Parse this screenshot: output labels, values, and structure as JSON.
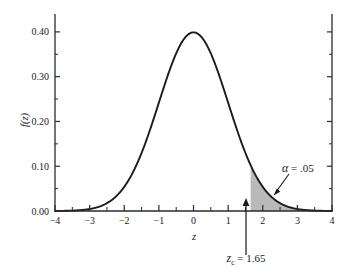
{
  "chart_data": {
    "type": "line",
    "title": "",
    "subtitle": "",
    "xlabel": "z",
    "ylabel": "f(z)",
    "xlim": [
      -4,
      4
    ],
    "ylim": [
      0.0,
      0.44
    ],
    "grid": false,
    "legend": "none",
    "x_ticks": [
      -4,
      -3,
      -2,
      -1,
      0,
      1,
      2,
      3,
      4
    ],
    "x_tick_labels": [
      "-4",
      "-3",
      "-2",
      "-1",
      "0",
      "1",
      "2",
      "3",
      "4"
    ],
    "x_minor_tick_step": 0.5,
    "y_ticks": [
      0.0,
      0.1,
      0.2,
      0.3,
      0.4
    ],
    "y_tick_labels": [
      "0.00",
      "0.10",
      "0.20",
      "0.30",
      "0.40"
    ],
    "y_minor_tick_step": 0.05,
    "series": [
      {
        "name": "standard normal density f(z)",
        "distribution": "normal",
        "mean": 0,
        "sd": 1,
        "peak_value": 0.3989,
        "x": [
          -4.0,
          -3.5,
          -3.0,
          -2.5,
          -2.0,
          -1.65,
          -1.5,
          -1.0,
          -0.5,
          0.0,
          0.5,
          1.0,
          1.5,
          1.65,
          2.0,
          2.5,
          3.0,
          3.5,
          4.0
        ],
        "values": [
          0.0001,
          0.0009,
          0.0044,
          0.0175,
          0.054,
          0.1023,
          0.1295,
          0.242,
          0.3521,
          0.3989,
          0.3521,
          0.242,
          0.1295,
          0.1023,
          0.054,
          0.0175,
          0.0044,
          0.0009,
          0.0001
        ]
      }
    ],
    "shaded_region": {
      "label": "rejection region (right tail)",
      "from": 1.65,
      "to": 4,
      "area": 0.05,
      "fill_color": "#b9b9b9"
    },
    "annotations": [
      {
        "name": "alpha-annotation",
        "text_symbol": "α",
        "text_rest": " = .05",
        "points_to_x": 2.45,
        "points_to_y": 0.028
      },
      {
        "name": "critical-value-annotation",
        "text_symbol": "z",
        "text_subscript": "c",
        "text_rest": " = 1.65",
        "points_to_x": 1.65,
        "points_to_y": 0.0
      }
    ]
  },
  "chart": {
    "y_axis_title": "f(z)",
    "x_axis_title": "z",
    "y_labels": [
      "0.40",
      "0.30",
      "0.20",
      "0.10",
      "0.00"
    ],
    "x_labels": [
      "-4",
      "-3",
      "-2",
      "-1",
      "0",
      "1",
      "2",
      "3",
      "4"
    ],
    "alpha_symbol": "α",
    "alpha_value": " = .05",
    "zc_symbol": "z",
    "zc_subscript": "c",
    "zc_value": " = 1.65"
  },
  "colors": {
    "curve": "#1a1a1a",
    "axis": "#2b2b2b",
    "shade": "#b9b9b9",
    "background": "#ffffff"
  }
}
